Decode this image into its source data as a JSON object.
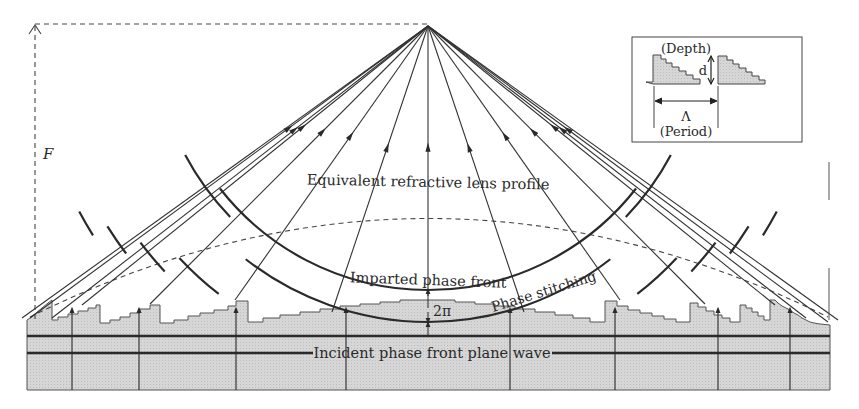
{
  "diagram": {
    "labels": {
      "focal_length": "F",
      "equivalent_lens": "Equivalent refractive lens profile",
      "imparted_front": "Imparted phase front",
      "phase_stitching": "Phase stitching",
      "two_pi": "2π",
      "incident_wave": "Incident phase front plane wave"
    },
    "inset": {
      "depth_label": "(Depth)",
      "depth_symbol": "d",
      "period_symbol": "Λ",
      "period_label": "(Period)"
    },
    "colors": {
      "substrate": "#d4d4d4",
      "lines": "#2a2a2a"
    }
  }
}
